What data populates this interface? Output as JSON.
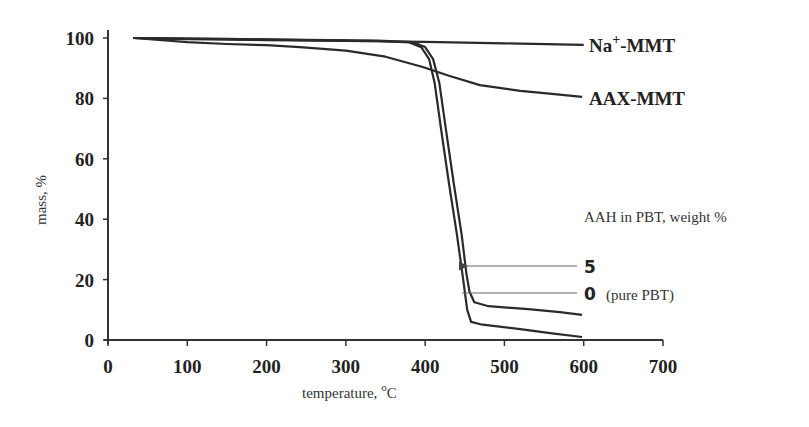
{
  "chart_data": {
    "type": "line",
    "title": "",
    "xlabel": "temperature, °C",
    "xlabel_text": "temperature, ",
    "xlabel_unit_sup": "o",
    "xlabel_unit": "C",
    "ylabel": "mass, %",
    "xlim": [
      0,
      700
    ],
    "ylim": [
      0,
      100
    ],
    "xticks": [
      0,
      100,
      200,
      300,
      400,
      500,
      600,
      700
    ],
    "yticks": [
      0,
      20,
      40,
      60,
      80,
      100
    ],
    "grid": false,
    "legend_title": "AAH in PBT, weight %",
    "series": [
      {
        "name": "Na+-MMT",
        "label_main": "Na",
        "label_sup": "+",
        "label_rest": "-MMT",
        "x": [
          32,
          100,
          200,
          300,
          400,
          500,
          600
        ],
        "y": [
          100,
          99.6,
          99.3,
          99.0,
          98.7,
          98.2,
          97.7
        ]
      },
      {
        "name": "AAX-MMT",
        "label_main": "AAX-MMT",
        "x": [
          32,
          100,
          150,
          200,
          242,
          300,
          350,
          397,
          430,
          469,
          520,
          560,
          598
        ],
        "y": [
          100,
          98.6,
          98.0,
          97.6,
          97.0,
          95.8,
          93.8,
          90.4,
          87.5,
          84.4,
          82.5,
          81.5,
          80.5
        ]
      },
      {
        "name": "5",
        "label_main": "5",
        "x": [
          32,
          150,
          250,
          340,
          380,
          395,
          405,
          412,
          420,
          430,
          440,
          448,
          453,
          458,
          470,
          520,
          560,
          598
        ],
        "y": [
          100,
          99.6,
          99.3,
          99.0,
          98.5,
          97,
          93,
          85,
          70,
          52,
          35,
          20,
          10,
          6,
          5.2,
          3.6,
          2.2,
          1.0
        ]
      },
      {
        "name": "0 (pure PBT)",
        "label_main": "0",
        "label_note": "(pure PBT)",
        "x": [
          32,
          150,
          250,
          340,
          385,
          400,
          410,
          418,
          426,
          436,
          446,
          452,
          456,
          462,
          480,
          530,
          570,
          598
        ],
        "y": [
          100,
          99.7,
          99.4,
          99.1,
          98.6,
          97,
          93,
          85,
          70,
          52,
          35,
          22,
          16,
          12.5,
          11.2,
          10.2,
          9.2,
          8.3
        ]
      }
    ],
    "annotations": [
      {
        "text": "5",
        "points_to_series": "5",
        "arrow": true
      },
      {
        "text": "0 (pure PBT)",
        "points_to_series": "0 (pure PBT)",
        "arrow": false
      }
    ]
  }
}
